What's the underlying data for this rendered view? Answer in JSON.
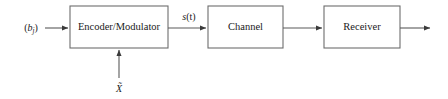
{
  "diagram": {
    "blocks": [
      {
        "id": "encoder",
        "label": "Encoder/Modulator"
      },
      {
        "id": "channel",
        "label": "Channel"
      },
      {
        "id": "receiver",
        "label": "Receiver"
      }
    ],
    "signals": {
      "input_open_paren": "(",
      "input_symbol": "b",
      "input_subscript": "j",
      "input_close_paren": ")",
      "input_full": "(b_j)",
      "between_encoder_channel_symbol": "s",
      "between_encoder_channel_arg": "(t)",
      "between_encoder_channel_full": "s(t)",
      "side_input_symbol": "X",
      "side_input_accent": "~",
      "side_input_full": "X̃"
    },
    "arrows": [
      {
        "id": "input-arrow",
        "from": "source",
        "to": "encoder",
        "direction": "right"
      },
      {
        "id": "encoder-channel-arrow",
        "from": "encoder",
        "to": "channel",
        "direction": "right"
      },
      {
        "id": "channel-receiver-arrow",
        "from": "channel",
        "to": "receiver",
        "direction": "right"
      },
      {
        "id": "receiver-output-arrow",
        "from": "receiver",
        "to": "output",
        "direction": "right"
      },
      {
        "id": "side-input-arrow",
        "from": "side-input",
        "to": "encoder",
        "direction": "up"
      }
    ],
    "colors": {
      "box_stroke": "#6d6d6d",
      "line_stroke": "#5a5a5a",
      "text": "#1a1a1a",
      "background": "#ffffff"
    }
  }
}
